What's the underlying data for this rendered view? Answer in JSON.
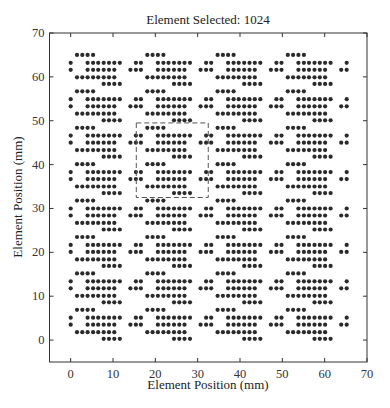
{
  "chart_data": {
    "type": "scatter",
    "title": "Element Selected: 1024",
    "xlabel": "Element Position (mm)",
    "ylabel": "Element Position (mm)",
    "xlim": [
      -5,
      70
    ],
    "ylim": [
      -5,
      70
    ],
    "xticks": [
      0,
      10,
      20,
      30,
      40,
      50,
      60,
      70
    ],
    "yticks": [
      0,
      10,
      20,
      30,
      40,
      50,
      60,
      70
    ],
    "grid": false,
    "legend": null,
    "marker_color": "#2a2a2a",
    "marker_size_px": 2.1,
    "element_count": 1024,
    "tile_layout": {
      "columns": 4,
      "rows": 8,
      "column_origin_mm": [
        0,
        16.6,
        33.2,
        49.8
      ],
      "row_origin_mm": [
        65.0,
        56.7,
        48.4,
        40.1,
        31.8,
        23.5,
        15.2,
        6.9
      ],
      "tile_rows": [
        {
          "dy": 0.0,
          "dx": [
            1.5,
            2.75,
            4.0,
            5.3
          ]
        },
        {
          "dy": -1.8,
          "dx": [
            0.0,
            4.0,
            5.3,
            6.5,
            7.8,
            9.05,
            10.3,
            11.6,
            15.4
          ]
        },
        {
          "dy": -3.4,
          "dx": [
            0.0,
            4.0,
            5.3,
            6.5,
            7.8,
            9.05,
            10.3,
            14.1,
            15.4
          ]
        },
        {
          "dy": -5.1,
          "dx": [
            1.5,
            2.75,
            4.0,
            5.3,
            6.5,
            7.8,
            9.05,
            10.3
          ]
        },
        {
          "dy": -6.6,
          "dx": [
            7.8,
            9.05,
            10.3,
            11.6
          ]
        }
      ]
    },
    "selection_box": {
      "style": "dashed",
      "color": "#555555",
      "x": [
        15.5,
        32.5
      ],
      "y": [
        32.5,
        49.5
      ]
    }
  }
}
